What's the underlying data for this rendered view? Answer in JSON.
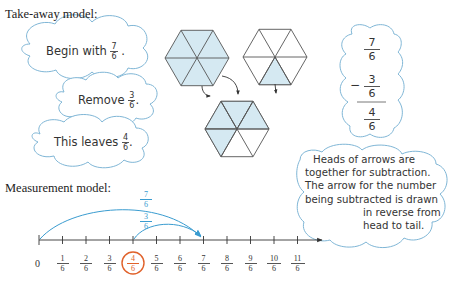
{
  "colors": {
    "cloud_outline": "#7fb6d6",
    "hex_fill": "#d5e9f2",
    "hex_stroke": "#555555",
    "arrow_blue": "#3a9cd0",
    "highlight_orange": "#e0612a",
    "text": "#333333"
  },
  "takeaway": {
    "heading": "Take-away model:",
    "clouds": [
      {
        "prefix": "Begin with",
        "num": "7",
        "den": "6",
        "suffix": "."
      },
      {
        "prefix": "Remove",
        "num": "3",
        "den": "6",
        "suffix": "."
      },
      {
        "prefix": "This leaves",
        "num": "4",
        "den": "6",
        "suffix": "."
      }
    ]
  },
  "hexagons": {
    "whole": {
      "shaded_parts": 6,
      "total_parts": 6
    },
    "partial": {
      "shaded_parts": 1,
      "total_parts": 6
    },
    "result": {
      "shaded_parts": 4,
      "total_parts": 6
    }
  },
  "vertical_calc": {
    "minuend": {
      "num": "7",
      "den": "6"
    },
    "operator": "−",
    "subtrahend": {
      "num": "3",
      "den": "6"
    },
    "result": {
      "num": "4",
      "den": "6"
    }
  },
  "note": {
    "lines": [
      "Heads of arrows are",
      "together for subtraction.",
      "The arrow for the number",
      "being subtracted is drawn",
      "in reverse from",
      "head to tail."
    ]
  },
  "measurement": {
    "heading": "Measurement model:",
    "arrow_long": {
      "num": "7",
      "den": "6"
    },
    "arrow_short": {
      "num": "3",
      "den": "6"
    },
    "zero_label": "0",
    "ticks": [
      {
        "num": "1",
        "den": "6"
      },
      {
        "num": "2",
        "den": "6"
      },
      {
        "num": "3",
        "den": "6"
      },
      {
        "num": "4",
        "den": "6",
        "highlighted": true
      },
      {
        "num": "5",
        "den": "6"
      },
      {
        "num": "6",
        "den": "6"
      },
      {
        "num": "7",
        "den": "6"
      },
      {
        "num": "8",
        "den": "6"
      },
      {
        "num": "9",
        "den": "6"
      },
      {
        "num": "10",
        "den": "6"
      },
      {
        "num": "11",
        "den": "6"
      }
    ]
  }
}
